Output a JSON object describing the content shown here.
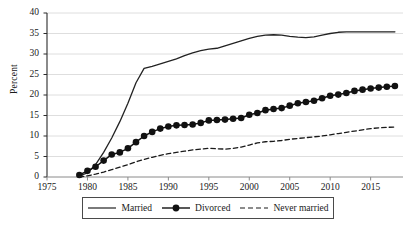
{
  "axes": {
    "ylabel": "Percent",
    "yticks": [
      "0",
      "5",
      "10",
      "15",
      "20",
      "25",
      "30",
      "35",
      "40"
    ],
    "xticks": [
      "1975",
      "1980",
      "1985",
      "1990",
      "1995",
      "2000",
      "2005",
      "2010",
      "2015"
    ]
  },
  "legend": {
    "married": "Married",
    "divorced": "Divorced",
    "never_married": "Never married"
  },
  "chart_data": {
    "type": "line",
    "title": "",
    "xlabel": "",
    "ylabel": "Percent",
    "xlim": [
      1975,
      2019
    ],
    "ylim": [
      0,
      40
    ],
    "grid": true,
    "legend_position": "bottom",
    "x": [
      1979,
      1980,
      1981,
      1982,
      1983,
      1984,
      1985,
      1986,
      1987,
      1988,
      1989,
      1990,
      1991,
      1992,
      1993,
      1994,
      1995,
      1996,
      1997,
      1998,
      1999,
      2000,
      2001,
      2002,
      2003,
      2004,
      2005,
      2006,
      2007,
      2008,
      2009,
      2010,
      2011,
      2012,
      2013,
      2014,
      2015,
      2016,
      2017,
      2018
    ],
    "series": [
      {
        "name": "Married",
        "style": "solid",
        "marker": "none",
        "color": "#222222",
        "values": [
          0.3,
          1.0,
          3.0,
          6.0,
          9.5,
          13.5,
          18.0,
          23.0,
          26.5,
          27.0,
          27.6,
          28.2,
          28.8,
          29.6,
          30.3,
          30.8,
          31.2,
          31.4,
          32.0,
          32.6,
          33.2,
          33.8,
          34.3,
          34.6,
          34.7,
          34.6,
          34.3,
          34.1,
          34.0,
          34.2,
          34.6,
          35.0,
          35.3,
          35.4,
          35.4,
          35.4,
          35.4,
          35.4,
          35.4,
          35.4
        ]
      },
      {
        "name": "Divorced",
        "style": "solid",
        "marker": "circle",
        "color": "#111111",
        "values": [
          0.5,
          1.5,
          2.5,
          4.0,
          5.5,
          6.0,
          7.0,
          8.5,
          10.0,
          11.0,
          11.8,
          12.3,
          12.6,
          12.7,
          12.8,
          13.2,
          13.8,
          13.9,
          14.0,
          14.2,
          14.4,
          15.2,
          15.6,
          16.3,
          16.6,
          16.8,
          17.4,
          18.0,
          18.3,
          18.6,
          19.2,
          19.8,
          20.1,
          20.5,
          21.0,
          21.3,
          21.6,
          21.8,
          22.0,
          22.2
        ]
      },
      {
        "name": "Never married",
        "style": "dashed",
        "marker": "none",
        "color": "#1a1a1a",
        "values": [
          0.0,
          0.3,
          0.7,
          1.2,
          1.8,
          2.4,
          3.0,
          3.7,
          4.3,
          4.8,
          5.3,
          5.7,
          6.0,
          6.3,
          6.6,
          6.8,
          7.0,
          6.9,
          6.8,
          7.0,
          7.3,
          7.8,
          8.3,
          8.6,
          8.7,
          8.9,
          9.2,
          9.4,
          9.6,
          9.8,
          10.0,
          10.3,
          10.6,
          10.9,
          11.2,
          11.5,
          11.8,
          12.0,
          12.1,
          12.2
        ]
      }
    ]
  }
}
